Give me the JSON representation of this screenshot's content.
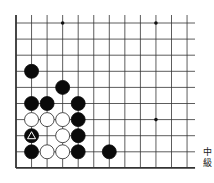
{
  "diagram": {
    "type": "go-board-partial",
    "grid": {
      "columns": 12,
      "rows": 10,
      "origin_x": 16,
      "origin_y": 23,
      "col_spacing": 15.55,
      "row_spacing": 16.1,
      "line_extend_right_to": 195,
      "line_extend_top_to": 15,
      "edges": [
        "left",
        "bottom"
      ],
      "line_color": "#333333"
    },
    "star_points": [
      {
        "col": 3,
        "row": 0
      },
      {
        "col": 9,
        "row": 0
      },
      {
        "col": 9,
        "row": 6
      }
    ],
    "stones": [
      {
        "col": 1,
        "row": 3,
        "color": "black"
      },
      {
        "col": 3,
        "row": 4,
        "color": "black"
      },
      {
        "col": 1,
        "row": 5,
        "color": "black"
      },
      {
        "col": 2,
        "row": 5,
        "color": "black"
      },
      {
        "col": 4,
        "row": 5,
        "color": "black"
      },
      {
        "col": 1,
        "row": 6,
        "color": "white"
      },
      {
        "col": 2,
        "row": 6,
        "color": "white"
      },
      {
        "col": 3,
        "row": 6,
        "color": "white"
      },
      {
        "col": 4,
        "row": 6,
        "color": "black"
      },
      {
        "col": 1,
        "row": 7,
        "color": "black",
        "marker": "triangle"
      },
      {
        "col": 3,
        "row": 7,
        "color": "white"
      },
      {
        "col": 4,
        "row": 7,
        "color": "black"
      },
      {
        "col": 1,
        "row": 8,
        "color": "black"
      },
      {
        "col": 2,
        "row": 8,
        "color": "white"
      },
      {
        "col": 3,
        "row": 8,
        "color": "white"
      },
      {
        "col": 4,
        "row": 8,
        "color": "black"
      },
      {
        "col": 6,
        "row": 8,
        "color": "black"
      }
    ],
    "stone_radius": 7,
    "colors": {
      "black_stone": "#0a0a0a",
      "white_stone": "#ffffff",
      "white_stone_outline": "#222222",
      "marker": "#ffffff"
    }
  },
  "caption": {
    "line1": "中",
    "line2": "級"
  }
}
